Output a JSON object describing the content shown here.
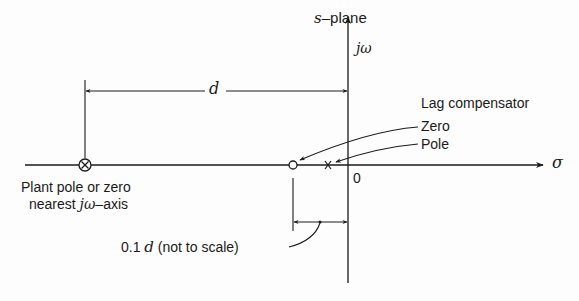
{
  "diagram": {
    "title_prefix": "s",
    "title_suffix": "–plane",
    "axes": {
      "vertical_label": "jω",
      "horizontal_label": "σ",
      "origin_label": "0"
    },
    "dimension_d": "d",
    "lag_compensator": {
      "heading": "Lag compensator",
      "zero_label": "Zero",
      "pole_label": "Pole"
    },
    "plant_marker": {
      "symbol": "⊗",
      "line1": "Plant pole or zero",
      "line2_prefix": "nearest ",
      "line2_italic": "jω",
      "line2_suffix": "–axis"
    },
    "small_dimension": {
      "value": "0.1 ",
      "var": "d",
      "note": " (not to scale)"
    },
    "colors": {
      "ink": "#1a1a1a",
      "background": "#fdfdfd"
    }
  }
}
